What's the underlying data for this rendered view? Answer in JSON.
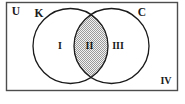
{
  "figure": {
    "name": "venn-diagram-two-sets",
    "universe_label": "U",
    "complement_region_label": "IV",
    "sets": [
      {
        "id": "left",
        "label": "K"
      },
      {
        "id": "right",
        "label": "C"
      }
    ],
    "regions": [
      {
        "id": "left-only",
        "label": "I"
      },
      {
        "id": "intersection",
        "label": "II",
        "shaded": true
      },
      {
        "id": "right-only",
        "label": "III"
      }
    ],
    "colors": {
      "background": "#ffffff",
      "stroke": "#1a1a1a",
      "border": "#4d4d4d",
      "shade_light": "#e8e8e8",
      "shade_dot": "#8a8a8a",
      "text": "#1a1a1a"
    }
  }
}
